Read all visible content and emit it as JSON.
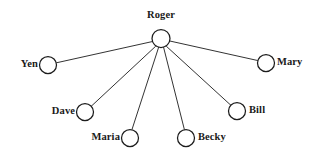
{
  "diagram": {
    "type": "sociogram-star-network",
    "title": "",
    "canvas": {
      "width": 319,
      "height": 158,
      "background": "#ffffff"
    },
    "style": {
      "node_fill": "#ffffff",
      "node_stroke": "#1c1c1c",
      "edge_stroke": "#1c1c1c",
      "label_color": "#1a1a1a"
    },
    "center_node": "Roger",
    "nodes": [
      {
        "id": "roger",
        "label": "Roger",
        "cx": 161,
        "cy": 38.5,
        "r": 9,
        "label_x": 161,
        "label_y": 10,
        "label_pos": "above"
      },
      {
        "id": "yen",
        "label": "Yen",
        "cx": 48,
        "cy": 65,
        "r": 8.5,
        "label_x": 38,
        "label_y": 59,
        "label_pos": "left"
      },
      {
        "id": "mary",
        "label": "Mary",
        "cx": 266,
        "cy": 63,
        "r": 8.5,
        "label_x": 277,
        "label_y": 57,
        "label_pos": "right"
      },
      {
        "id": "dave",
        "label": "Dave",
        "cx": 85,
        "cy": 112,
        "r": 8.5,
        "label_x": 75,
        "label_y": 106,
        "label_pos": "left"
      },
      {
        "id": "bill",
        "label": "Bill",
        "cx": 237,
        "cy": 111,
        "r": 8.5,
        "label_x": 249,
        "label_y": 105,
        "label_pos": "right"
      },
      {
        "id": "maria",
        "label": "Maria",
        "cx": 130,
        "cy": 138,
        "r": 8.5,
        "label_x": 120,
        "label_y": 132,
        "label_pos": "left"
      },
      {
        "id": "becky",
        "label": "Becky",
        "cx": 186,
        "cy": 138,
        "r": 8.5,
        "label_x": 198,
        "label_y": 132,
        "label_pos": "right"
      }
    ],
    "edges": [
      {
        "id": "edge-roger-yen",
        "from": "roger",
        "to": "yen",
        "x1": 152.6,
        "y1": 41.5,
        "x2": 56.4,
        "y2": 62.8
      },
      {
        "id": "edge-roger-mary",
        "from": "roger",
        "to": "mary",
        "x1": 169.8,
        "y1": 41.0,
        "x2": 257.6,
        "y2": 60.5
      },
      {
        "id": "edge-roger-dave",
        "from": "roger",
        "to": "dave",
        "x1": 155.5,
        "y1": 46.4,
        "x2": 91.5,
        "y2": 106.0
      },
      {
        "id": "edge-roger-bill",
        "from": "roger",
        "to": "bill",
        "x1": 166.5,
        "y1": 46.4,
        "x2": 230.8,
        "y2": 105.2
      },
      {
        "id": "edge-roger-maria",
        "from": "roger",
        "to": "maria",
        "x1": 158.6,
        "y1": 47.4,
        "x2": 132.0,
        "y2": 129.5
      },
      {
        "id": "edge-roger-becky",
        "from": "roger",
        "to": "becky",
        "x1": 163.6,
        "y1": 47.4,
        "x2": 184.4,
        "y2": 129.6
      }
    ]
  }
}
